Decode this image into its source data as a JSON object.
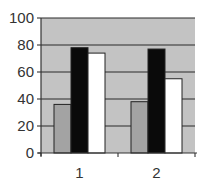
{
  "chart_data": {
    "type": "bar",
    "title": "",
    "xlabel": "",
    "ylabel": "",
    "categories": [
      "1",
      "2"
    ],
    "series": [
      {
        "name": "Series 1",
        "color": "#a3a3a3",
        "values": [
          36,
          38
        ]
      },
      {
        "name": "Series 2",
        "color": "#0a0a0a",
        "values": [
          78,
          77
        ]
      },
      {
        "name": "Series 3",
        "color": "#ffffff",
        "values": [
          74,
          55
        ]
      }
    ],
    "ylim": [
      0,
      100
    ],
    "yticks": [
      0,
      20,
      40,
      60,
      80,
      100
    ],
    "ytick_labels": [
      "0",
      "20",
      "40",
      "60",
      "80",
      "100"
    ],
    "grid": true,
    "legend": "none",
    "plot_background": "#c3c3c3"
  }
}
